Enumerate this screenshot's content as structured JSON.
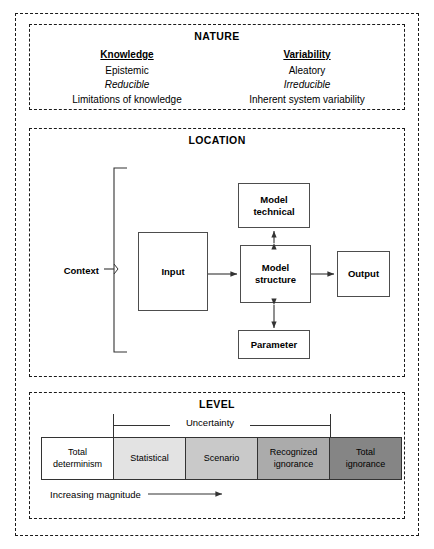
{
  "figure": {
    "sections": {
      "nature": {
        "title": "NATURE",
        "columns": [
          {
            "heading": "Knowledge",
            "lines": [
              "Epistemic",
              "Reducible",
              "Limitations of knowledge"
            ],
            "italic_index": 1
          },
          {
            "heading": "Variability",
            "lines": [
              "Aleatory",
              "Irreducible",
              "Inherent system variability"
            ],
            "italic_index": 1
          }
        ]
      },
      "location": {
        "title": "LOCATION",
        "context_label": "Context",
        "nodes": {
          "model_technical": "Model technical",
          "model_technical_line1": "Model",
          "model_technical_line2": "technical",
          "input": "Input",
          "model_structure_line1": "Model",
          "model_structure_line2": "structure",
          "output": "Output",
          "parameter": "Parameter"
        }
      },
      "level": {
        "title": "LEVEL",
        "uncertainty_label": "Uncertainty",
        "magnitude_label": "Increasing magnitude",
        "segments": [
          {
            "label": "Total determinism",
            "line1": "Total",
            "line2": "determinism",
            "color": "#ffffff"
          },
          {
            "label": "Statistical",
            "line1": "Statistical",
            "line2": "",
            "color": "#e3e3e3"
          },
          {
            "label": "Scenario",
            "line1": "Scenario",
            "line2": "",
            "color": "#c9c9c9"
          },
          {
            "label": "Recognized ignorance",
            "line1": "Recognized",
            "line2": "ignorance",
            "color": "#ababab"
          },
          {
            "label": "Total ignorance",
            "line1": "Total",
            "line2": "ignorance",
            "color": "#858585"
          }
        ]
      }
    },
    "colors": {
      "line": "#333333",
      "border": "#1a1a1a"
    }
  }
}
